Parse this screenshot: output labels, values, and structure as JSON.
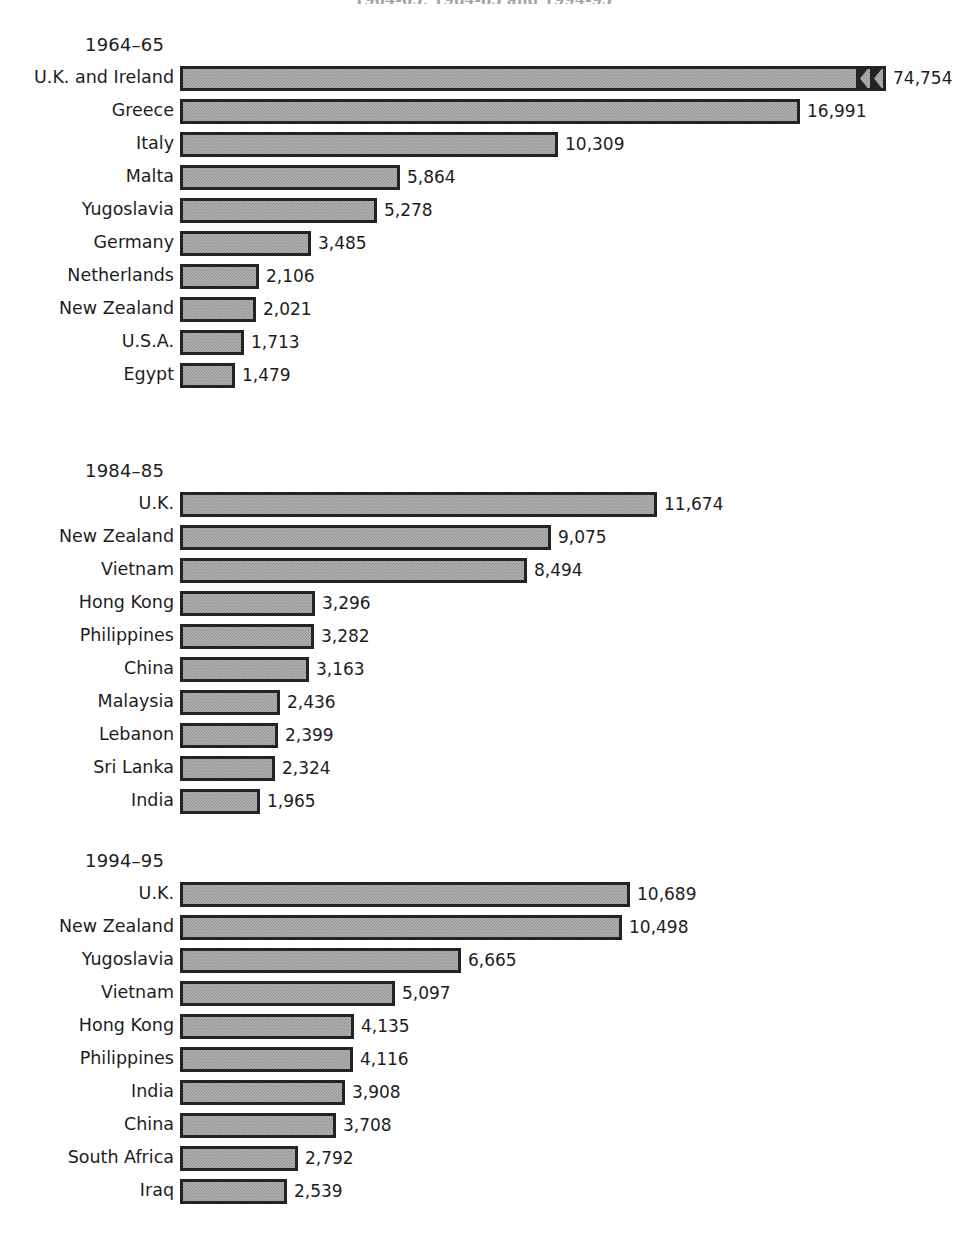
{
  "figure": {
    "title": "1964-65, 1984-85 and 1994-95",
    "value_unit": "persons"
  },
  "chart_data": {
    "type": "bar",
    "title": "1964-65, 1984-85 and 1994-95",
    "orientation": "horizontal",
    "xlabel": "",
    "ylabel": "",
    "grid": false,
    "legend": false,
    "panels": [
      {
        "heading": "1964–65",
        "pixels_per_unit": 0.0366,
        "axis_break": true,
        "categories": [
          "U.K. and Ireland",
          "Greece",
          "Italy",
          "Malta",
          "Yugoslavia",
          "Germany",
          "Netherlands",
          "New Zealand",
          "U.S.A.",
          "Egypt"
        ],
        "values": [
          74754,
          16991,
          10309,
          5864,
          5278,
          3485,
          2106,
          2021,
          1713,
          1479
        ],
        "labels": [
          "74,754",
          "16,991",
          "10,309",
          "5,864",
          "5,278",
          "3,485",
          "2,106",
          "2,021",
          "1,713",
          "1,479"
        ],
        "bar_px": [
          706,
          620,
          378,
          220,
          197,
          131,
          79,
          76,
          64,
          55
        ],
        "broken": [
          true,
          false,
          false,
          false,
          false,
          false,
          false,
          false,
          false,
          false
        ]
      },
      {
        "heading": "1984–85",
        "pixels_per_unit": 0.0409,
        "axis_break": false,
        "categories": [
          "U.K.",
          "New Zealand",
          "Vietnam",
          "Hong Kong",
          "Philippines",
          "China",
          "Malaysia",
          "Lebanon",
          "Sri Lanka",
          "India"
        ],
        "values": [
          11674,
          9075,
          8494,
          3296,
          3282,
          3163,
          2436,
          2399,
          2324,
          1965
        ],
        "labels": [
          "11,674",
          "9,075",
          "8,494",
          "3,296",
          "3,282",
          "3,163",
          "2,436",
          "2,399",
          "2,324",
          "1,965"
        ],
        "bar_px": [
          477,
          371,
          347,
          135,
          134,
          129,
          100,
          98,
          95,
          80
        ],
        "broken": [
          false,
          false,
          false,
          false,
          false,
          false,
          false,
          false,
          false,
          false
        ]
      },
      {
        "heading": "1994–95",
        "pixels_per_unit": 0.0421,
        "axis_break": false,
        "categories": [
          "U.K.",
          "New Zealand",
          "Yugoslavia",
          "Vietnam",
          "Hong Kong",
          "Philippines",
          "India",
          "China",
          "South Africa",
          "Iraq"
        ],
        "values": [
          10689,
          10498,
          6665,
          5097,
          4135,
          4116,
          3908,
          3708,
          2792,
          2539
        ],
        "labels": [
          "10,689",
          "10,498",
          "6,665",
          "5,097",
          "4,135",
          "4,116",
          "3,908",
          "3,708",
          "2,792",
          "2,539"
        ],
        "bar_px": [
          450,
          442,
          281,
          215,
          174,
          173,
          165,
          156,
          118,
          107
        ],
        "broken": [
          false,
          false,
          false,
          false,
          false,
          false,
          false,
          false,
          false,
          false
        ]
      }
    ]
  }
}
